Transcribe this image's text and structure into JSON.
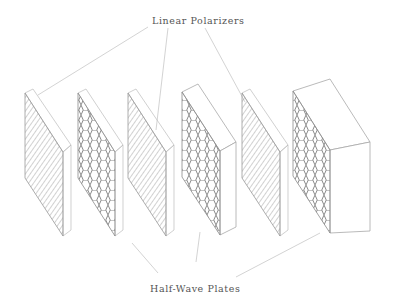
{
  "diagram": {
    "labels": {
      "top": "Linear Polarizers",
      "bottom": "Half-Wave Plates"
    },
    "colors": {
      "line": "#9a9a9a",
      "hatch": "#8c8c8c",
      "leader": "#c4c4c4",
      "text": "#555555"
    },
    "plates": [
      {
        "type": "linear-polarizer",
        "hatch": "diagonal-lines"
      },
      {
        "type": "half-wave-plate",
        "hatch": "hexagonal"
      },
      {
        "type": "linear-polarizer",
        "hatch": "diagonal-lines"
      },
      {
        "type": "half-wave-plate",
        "hatch": "hexagonal",
        "thick": true
      },
      {
        "type": "linear-polarizer",
        "hatch": "diagonal-lines"
      },
      {
        "type": "half-wave-plate",
        "hatch": "hexagonal",
        "thick": true
      }
    ]
  }
}
